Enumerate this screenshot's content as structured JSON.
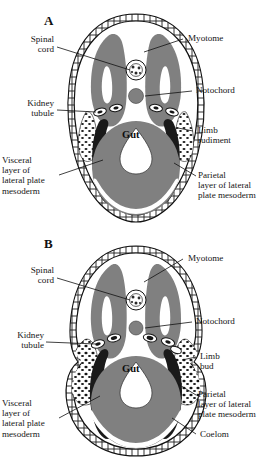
{
  "figure": {
    "type": "biological-diagram",
    "colors": {
      "mesoderm_gray": "#808080",
      "dark_structure": "#1a1a1a",
      "background": "#ffffff",
      "line": "#111111"
    }
  },
  "panels": [
    {
      "id": "A",
      "letter": "A",
      "gut_label": "Gut",
      "labels": {
        "spinal_cord": "Spinal\ncord",
        "kidney_tubule": "Kidney\ntubule",
        "visceral_layer": "Visceral\nlayer of\nlateral plate\nmesoderm",
        "myotome": "Myotome",
        "notochord": "Notochord",
        "limb": "Limb\nrudiment",
        "parietal_layer": "Parietal\nlayer of lateral\nplate mesoderm"
      }
    },
    {
      "id": "B",
      "letter": "B",
      "gut_label": "Gut",
      "labels": {
        "spinal_cord": "Spinal\ncord",
        "kidney_tubule": "Kidney\ntubule",
        "visceral_layer": "Visceral\nlayer of\nlateral plate\nmesoderm",
        "myotome": "Myotome",
        "notochord": "Notochord",
        "limb": "Limb\nbud",
        "parietal_layer": "Parietal\nlayer of lateral\nplate mesoderm",
        "coelom": "Coelom"
      }
    }
  ]
}
